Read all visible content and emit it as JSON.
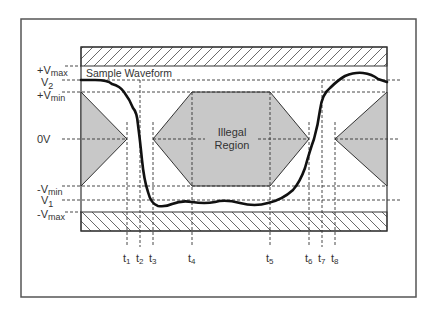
{
  "diagram": {
    "title_label": "Sample Waveform",
    "region_label_line1": "Illegal",
    "region_label_line2": "Region",
    "voltage_labels": {
      "vmax_pos": {
        "prefix": "+V",
        "sub": "max"
      },
      "v2": {
        "prefix": "V",
        "sub": "2"
      },
      "vmin_pos": {
        "prefix": "+V",
        "sub": "min"
      },
      "zero": {
        "prefix": "0V",
        "sub": ""
      },
      "vmin_neg": {
        "prefix": "-V",
        "sub": "min"
      },
      "v1": {
        "prefix": "V",
        "sub": "1"
      },
      "vmax_neg": {
        "prefix": "-V",
        "sub": "max"
      }
    },
    "time_labels": [
      {
        "prefix": "t",
        "sub": "1"
      },
      {
        "prefix": "t",
        "sub": "2"
      },
      {
        "prefix": "t",
        "sub": "3"
      },
      {
        "prefix": "t",
        "sub": "4"
      },
      {
        "prefix": "t",
        "sub": "5"
      },
      {
        "prefix": "t",
        "sub": "6"
      },
      {
        "prefix": "t",
        "sub": "7"
      },
      {
        "prefix": "t",
        "sub": "8"
      }
    ],
    "colors": {
      "illegal_fill": "#c8c8c8",
      "line": "#333333",
      "waveform": "#111111"
    }
  }
}
